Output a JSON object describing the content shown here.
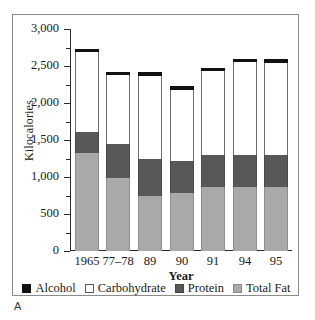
{
  "panel": {
    "label": "A"
  },
  "chart_data": {
    "type": "bar",
    "subtype": "stacked-bar",
    "title": "",
    "xlabel": "Year",
    "ylabel": "Kilocalories",
    "categories": [
      "1965",
      "77–78",
      "89",
      "90",
      "91",
      "94",
      "95"
    ],
    "ylim": [
      0,
      3000
    ],
    "yticks": [
      0,
      500,
      1000,
      1500,
      2000,
      2500,
      3000
    ],
    "ytick_labels": [
      "0",
      "500",
      "1,000",
      "1,500",
      "2,000",
      "2,500",
      "3,000"
    ],
    "minor_tick_interval": 250,
    "grid": false,
    "legend_position": "bottom",
    "stack_order_bottom_to_top": [
      "Total Fat",
      "Protein",
      "Carbohydrate",
      "Alcohol"
    ],
    "series": [
      {
        "name": "Total Fat",
        "color": "#a9a9a9",
        "values": [
          1330,
          980,
          750,
          780,
          870,
          870,
          860
        ]
      },
      {
        "name": "Protein",
        "color": "#585858",
        "values": [
          280,
          470,
          500,
          430,
          430,
          430,
          440
        ]
      },
      {
        "name": "Carbohydrate",
        "color": "#ffffff",
        "values": [
          1080,
          930,
          1120,
          970,
          1130,
          1250,
          1240
        ]
      },
      {
        "name": "Alcohol",
        "color": "#111111",
        "values": [
          40,
          40,
          50,
          50,
          40,
          50,
          50
        ]
      }
    ],
    "totals": [
      2730,
      2420,
      2420,
      2230,
      2470,
      2600,
      2590
    ]
  },
  "legend": {
    "items": [
      {
        "label": "Alcohol",
        "swatch": "alcohol-swatch"
      },
      {
        "label": "Carbohydrate",
        "swatch": "carbohydrate-swatch"
      },
      {
        "label": "Protein",
        "swatch": "protein-swatch"
      },
      {
        "label": "Total Fat",
        "swatch": "total-fat-swatch"
      }
    ]
  }
}
